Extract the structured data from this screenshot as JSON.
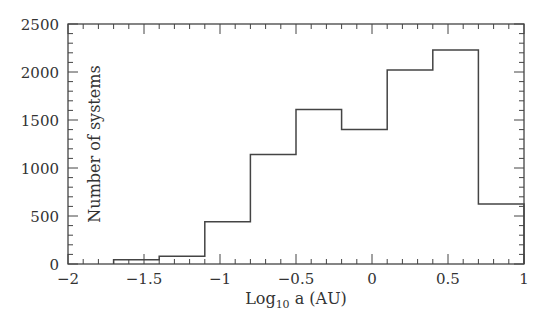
{
  "chart_data": {
    "type": "bar",
    "subtype": "histogram-step",
    "title": "",
    "xlabel": "Log10 a (AU)",
    "xlabel_parts": {
      "base": "Log",
      "subscript": "10",
      "rest": " a (AU)"
    },
    "ylabel": "Number of systems",
    "xlim": [
      -2,
      1
    ],
    "ylim": [
      0,
      2500
    ],
    "grid": false,
    "legend": null,
    "x_ticks": [
      "-2",
      "-1.5",
      "-1",
      "-0.5",
      "0",
      "0.5",
      "1"
    ],
    "y_ticks": [
      "0",
      "500",
      "1000",
      "1500",
      "2000",
      "2500"
    ],
    "bin_edges": [
      -1.7,
      -1.4,
      -1.1,
      -0.8,
      -0.5,
      -0.2,
      0.1,
      0.4,
      0.7,
      1.0
    ],
    "categories": [
      "-1.7 to -1.4",
      "-1.4 to -1.1",
      "-1.1 to -0.8",
      "-0.8 to -0.5",
      "-0.5 to -0.2",
      "-0.2 to 0.1",
      "0.1 to 0.4",
      "0.4 to 0.7",
      "0.7 to 1.0"
    ],
    "values": [
      45,
      80,
      440,
      1140,
      1610,
      1400,
      2020,
      2230,
      625
    ]
  },
  "colors": {
    "line": "#444444",
    "background": "#ffffff",
    "text": "#333333"
  }
}
